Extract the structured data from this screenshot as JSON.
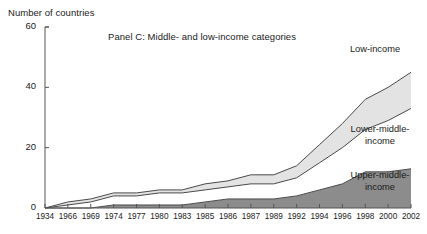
{
  "chart_data": {
    "type": "area",
    "title": "Panel C: Middle- and low-income categories",
    "ylabel": "Number of countries",
    "xlabel": "",
    "ylim": [
      0,
      60
    ],
    "yticks": [
      0,
      20,
      40,
      60
    ],
    "grid": false,
    "stacked": true,
    "legend_position": "inline-right",
    "x": [
      1934,
      1966,
      1969,
      1974,
      1977,
      1980,
      1983,
      1985,
      1986,
      1987,
      1989,
      1992,
      1994,
      1996,
      1998,
      2000,
      2002
    ],
    "xtick_labels": [
      "1934",
      "1966",
      "1969",
      "1974",
      "1977",
      "1980",
      "1983",
      "1985",
      "1986",
      "1987",
      "1989",
      "1992",
      "1994",
      "1996",
      "1998",
      "2000",
      "2002"
    ],
    "series": [
      {
        "name": "Upper-middle-income",
        "color": "#8c8c8c",
        "values": [
          0,
          0,
          0,
          1,
          1,
          1,
          1,
          2,
          3,
          3,
          3,
          4,
          6,
          8,
          12,
          12,
          13
        ]
      },
      {
        "name": "Lower-middle-income",
        "color": "#ffffff",
        "values": [
          0,
          1,
          2,
          3,
          3,
          4,
          4,
          4,
          4,
          5,
          5,
          6,
          9,
          12,
          14,
          17,
          20
        ]
      },
      {
        "name": "Low-income",
        "color": "#e3e3e3",
        "values": [
          0,
          1,
          1,
          1,
          1,
          1,
          1,
          2,
          2,
          3,
          3,
          4,
          6,
          8,
          10,
          11,
          12
        ]
      }
    ]
  },
  "labels": {
    "low_income": "Low-income",
    "lower_middle_line1": "Lower-middle-",
    "lower_middle_line2": "income",
    "upper_middle_line1": "Upper-middle-",
    "upper_middle_line2": "income"
  },
  "colors": {
    "axis": "#555555",
    "text": "#1a1a1a",
    "upper_middle_fill": "#8c8c8c",
    "lower_middle_fill": "#ffffff",
    "low_income_fill": "#e3e3e3",
    "stroke": "#4a4a4a",
    "background": "#ffffff"
  }
}
